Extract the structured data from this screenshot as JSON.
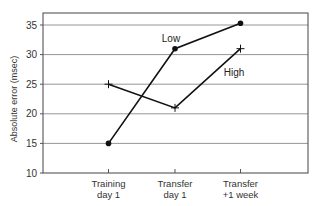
{
  "chart_data": {
    "type": "line",
    "title": "",
    "xlabel": "",
    "ylabel": "Absolute error (msec)",
    "ylim": [
      10,
      36.5
    ],
    "yticks": [
      10,
      15,
      20,
      25,
      30,
      35
    ],
    "grid": "horizontal",
    "legend": "inline labels",
    "categories": [
      "Training day 1",
      "Transfer day 1",
      "Transfer +1 week"
    ],
    "category_lines": [
      [
        "Training",
        "day 1"
      ],
      [
        "Transfer",
        "day 1"
      ],
      [
        "Transfer",
        "+1 week"
      ]
    ],
    "series": [
      {
        "name": "Low",
        "marker": "dot",
        "values": [
          15,
          31,
          35.3
        ]
      },
      {
        "name": "High",
        "marker": "cross",
        "values": [
          25,
          21,
          31
        ]
      }
    ],
    "annotations": [
      {
        "text": "Low",
        "near": "Transfer day 1",
        "y": 34
      },
      {
        "text": "High",
        "near": "Transfer +1 week",
        "y": 26
      }
    ]
  }
}
